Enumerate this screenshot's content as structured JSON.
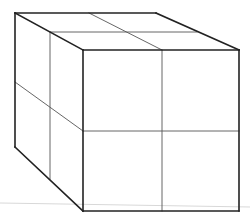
{
  "diagram": {
    "title": "",
    "colors": {
      "background": "#ffffff",
      "outline": "#222222",
      "grid_line": "#555555",
      "horizon_line": "#d8d8d8"
    },
    "stroke_widths": {
      "outline": 1.6,
      "grid": 0.9,
      "horizon": 1.0
    },
    "horizon": {
      "x1": 0,
      "y1": 203,
      "x2": 250,
      "y2": 207
    },
    "outline_edges": [
      {
        "id": "top-back-edge",
        "x1": 15,
        "y1": 13,
        "x2": 156,
        "y2": 13
      },
      {
        "id": "top-right-edge",
        "x1": 156,
        "y1": 13,
        "x2": 239,
        "y2": 50
      },
      {
        "id": "top-left-edge",
        "x1": 15,
        "y1": 13,
        "x2": 83,
        "y2": 50
      },
      {
        "id": "front-top-edge",
        "x1": 83,
        "y1": 50,
        "x2": 239,
        "y2": 50
      },
      {
        "id": "front-left-edge",
        "x1": 83,
        "y1": 50,
        "x2": 83,
        "y2": 211
      },
      {
        "id": "front-right-edge",
        "x1": 239,
        "y1": 50,
        "x2": 239,
        "y2": 211
      },
      {
        "id": "front-bottom-edge",
        "x1": 83,
        "y1": 211,
        "x2": 239,
        "y2": 211
      },
      {
        "id": "back-left-edge",
        "x1": 15,
        "y1": 13,
        "x2": 15,
        "y2": 147
      },
      {
        "id": "bottom-left-edge",
        "x1": 15,
        "y1": 147,
        "x2": 83,
        "y2": 211
      }
    ],
    "grid_lines": [
      {
        "id": "top-face-diagonal-divider",
        "x1": 89,
        "y1": 13,
        "x2": 162,
        "y2": 50
      },
      {
        "id": "top-face-horizontal-divider",
        "x1": 50,
        "y1": 32,
        "x2": 197,
        "y2": 32
      },
      {
        "id": "left-face-vertical-divider",
        "x1": 50,
        "y1": 32,
        "x2": 50,
        "y2": 179
      },
      {
        "id": "left-face-diagonal-divider",
        "x1": 15,
        "y1": 82,
        "x2": 83,
        "y2": 131
      },
      {
        "id": "front-face-vertical-divider",
        "x1": 162,
        "y1": 50,
        "x2": 162,
        "y2": 211
      },
      {
        "id": "front-face-horizontal-divider",
        "x1": 83,
        "y1": 131,
        "x2": 239,
        "y2": 131
      }
    ]
  }
}
